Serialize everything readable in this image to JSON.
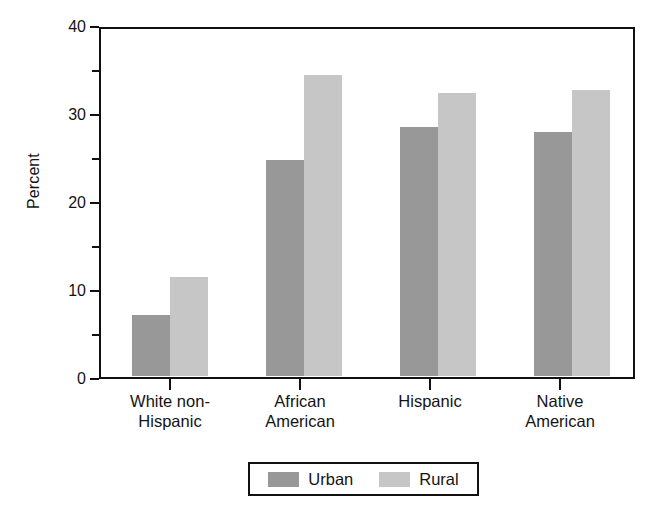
{
  "chart_data": {
    "type": "bar",
    "title": "",
    "subtitle": "",
    "xlabel": "",
    "ylabel": "Percent",
    "categories": [
      "White non-Hispanic",
      "African American",
      "Hispanic",
      "Native American"
    ],
    "series": [
      {
        "name": "Urban",
        "color": "#989898",
        "values": [
          7.0,
          24.8,
          28.6,
          28.0
        ]
      },
      {
        "name": "Rural",
        "color": "#c6c6c6",
        "values": [
          11.4,
          34.5,
          32.4,
          32.8
        ]
      }
    ],
    "ylim": [
      0,
      40
    ],
    "y_major_ticks": [
      0,
      10,
      20,
      30,
      40
    ],
    "y_minor_ticks": [
      5,
      15,
      25,
      35
    ],
    "y_tick_labels": [
      "0",
      "10",
      "20",
      "30",
      "40"
    ],
    "grid": false,
    "legend_position": "bottom",
    "frame": true,
    "annotations": []
  },
  "axis": {
    "y_title": "Percent"
  },
  "category_labels": [
    {
      "line1": "White non-",
      "line2": "Hispanic"
    },
    {
      "line1": "African",
      "line2": "American"
    },
    {
      "line1": "Hispanic",
      "line2": ""
    },
    {
      "line1": "Native",
      "line2": "American"
    }
  ],
  "legend": {
    "entries": [
      {
        "label": "Urban",
        "color": "#989898"
      },
      {
        "label": "Rural",
        "color": "#c6c6c6"
      }
    ]
  },
  "colors": {
    "urban": "#989898",
    "rural": "#c6c6c6",
    "axis": "#101010",
    "text": "#141414",
    "background": "#ffffff"
  }
}
